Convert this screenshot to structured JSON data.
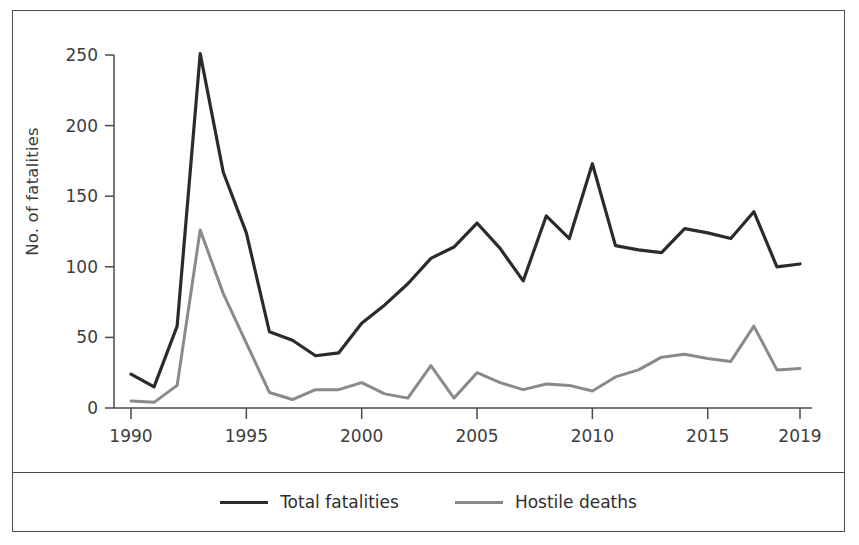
{
  "chart_data": {
    "type": "line",
    "title": "",
    "xlabel": "",
    "ylabel": "No. of fatalities",
    "xlim": [
      1990,
      2019
    ],
    "ylim": [
      0,
      250
    ],
    "grid": false,
    "legend_position": "bottom",
    "x": [
      1990,
      1991,
      1992,
      1993,
      1994,
      1995,
      1996,
      1997,
      1998,
      1999,
      2000,
      2001,
      2002,
      2003,
      2004,
      2005,
      2006,
      2007,
      2008,
      2009,
      2010,
      2011,
      2012,
      2013,
      2014,
      2015,
      2016,
      2017,
      2018,
      2019
    ],
    "xticks": [
      1990,
      1995,
      2000,
      2005,
      2010,
      2015,
      2019
    ],
    "xticklabels": [
      "1990",
      "1995",
      "2000",
      "2005",
      "2010",
      "2015",
      "2019"
    ],
    "yticks": [
      0,
      50,
      100,
      150,
      200,
      250
    ],
    "yticklabels": [
      "0",
      "50",
      "100",
      "150",
      "200",
      "250"
    ],
    "series": [
      {
        "name": "Total fatalities",
        "color": "#2b2b2b",
        "values": [
          24,
          15,
          58,
          251,
          167,
          124,
          54,
          48,
          37,
          39,
          60,
          73,
          88,
          106,
          114,
          131,
          113,
          90,
          136,
          120,
          173,
          115,
          112,
          110,
          127,
          124,
          120,
          139,
          100,
          102
        ]
      },
      {
        "name": "Hostile deaths",
        "color": "#8a8a8a",
        "values": [
          5,
          4,
          16,
          126,
          81,
          46,
          11,
          6,
          13,
          13,
          18,
          10,
          7,
          30,
          7,
          25,
          18,
          13,
          17,
          16,
          12,
          22,
          27,
          36,
          38,
          35,
          33,
          58,
          27,
          28
        ]
      }
    ]
  },
  "legend": {
    "items": [
      {
        "label": "Total fatalities",
        "style": "total"
      },
      {
        "label": "Hostile deaths",
        "style": "hostile"
      }
    ]
  },
  "colors": {
    "total_fatalities": "#2b2b2b",
    "hostile_deaths": "#8a8a8a",
    "frame": "#4a4a4a",
    "text": "#3d3d3d",
    "background": "#ffffff"
  }
}
